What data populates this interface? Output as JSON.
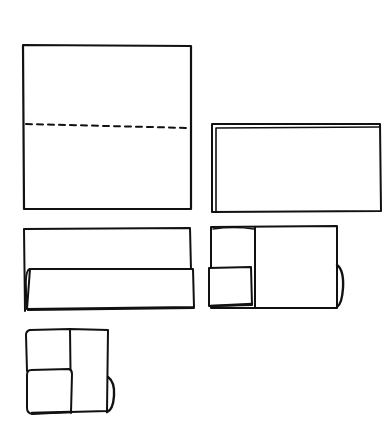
{
  "diagram": {
    "type": "paper-folding-steps",
    "ink_color": "#111111",
    "background": "#ffffff",
    "steps": [
      {
        "index": 1,
        "description": "Square sheet with horizontal dashed fold line",
        "box": {
          "x": 23,
          "y": 45,
          "w": 168,
          "h": 164
        },
        "fold_line": {
          "style": "dashed",
          "x1": 25,
          "y1": 124,
          "x2": 190,
          "y2": 128
        }
      },
      {
        "index": 2,
        "description": "Sheet folded in half into horizontal rectangle (double edge on top and left)",
        "box": {
          "x": 212,
          "y": 124,
          "w": 169,
          "h": 88
        }
      },
      {
        "index": 3,
        "description": "Rectangle with bottom strip folded up",
        "box": {
          "x": 24,
          "y": 228,
          "w": 167,
          "h": 83
        },
        "flap": {
          "x": 26,
          "y": 269,
          "w": 168,
          "h": 40
        }
      },
      {
        "index": 4,
        "description": "Left portion folded over; small square flap at bottom-left, rounded edge on right",
        "box": {
          "x": 211,
          "y": 226,
          "w": 126,
          "h": 82
        },
        "divider_x": 255,
        "flap": {
          "x": 208,
          "y": 268,
          "w": 44,
          "h": 39
        },
        "bump": {
          "x": 337,
          "y1": 265,
          "y2": 307,
          "out": 5
        }
      },
      {
        "index": 5,
        "description": "Final folded square: left column with two square panels, right panel with rounded edge",
        "box": {
          "x": 26,
          "y": 329,
          "w": 82,
          "h": 85
        },
        "divider_x": 70,
        "fold_y": 370,
        "bump": {
          "x": 108,
          "y1": 377,
          "y2": 412,
          "out": 6
        }
      }
    ]
  }
}
